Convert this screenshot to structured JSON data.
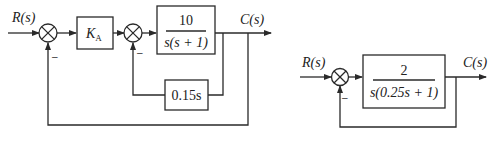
{
  "diagrams": [
    {
      "id": "left",
      "input_label": "R(s)",
      "output_label": "C(s)",
      "gain_block": {
        "label_main": "K",
        "label_sub": "A"
      },
      "plant_block": {
        "numerator": "10",
        "denominator": "s(s + 1)"
      },
      "inner_feedback_block": {
        "label": "0.15s"
      },
      "summing_junction_1": {
        "feedback_sign": "–"
      },
      "summing_junction_2": {
        "feedback_sign": "–"
      }
    },
    {
      "id": "right",
      "input_label": "R(s)",
      "output_label": "C(s)",
      "plant_block": {
        "numerator": "2",
        "denominator": "s(0.25s + 1)"
      },
      "summing_junction": {
        "feedback_sign": "–"
      }
    }
  ]
}
